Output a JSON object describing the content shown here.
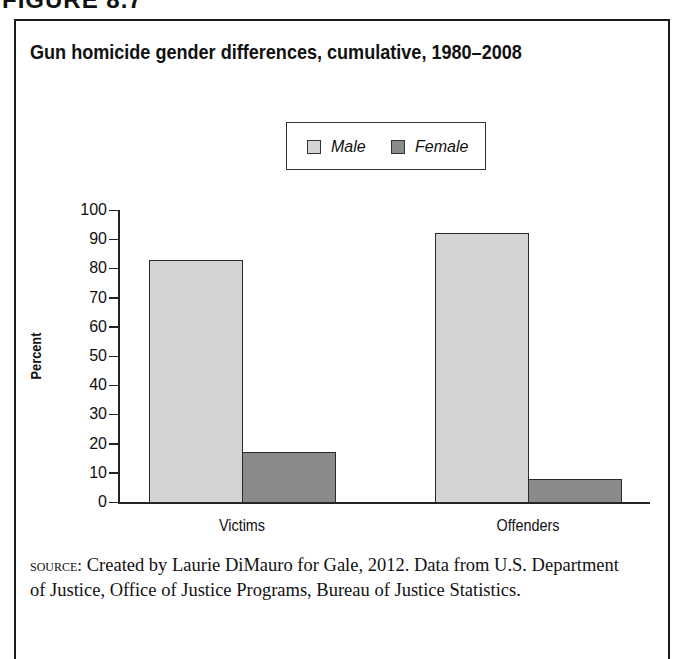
{
  "figure_label": "FIGURE 8.7",
  "chart_data": {
    "type": "bar",
    "title": "Gun homicide gender differences, cumulative, 1980–2008",
    "categories": [
      "Victims",
      "Offenders"
    ],
    "series": [
      {
        "name": "Male",
        "values": [
          83,
          92
        ],
        "color": "#d4d4d4"
      },
      {
        "name": "Female",
        "values": [
          17,
          8
        ],
        "color": "#8a8a8a"
      }
    ],
    "xlabel": "",
    "ylabel": "Percent",
    "ylim": [
      0,
      100
    ],
    "yticks": [
      0,
      10,
      20,
      30,
      40,
      50,
      60,
      70,
      80,
      90,
      100
    ],
    "grid": false,
    "legend_position": "top-center"
  },
  "legend": {
    "male": "Male",
    "female": "Female"
  },
  "source": {
    "lead": "source:",
    "text": " Created by Laurie DiMauro for Gale, 2012. Data from U.S. Department of Justice, Office of Justice Programs, Bureau of Justice Statistics."
  }
}
